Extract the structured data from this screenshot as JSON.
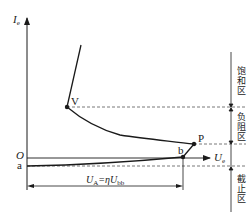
{
  "diagram": {
    "axes": {
      "y_label": "I",
      "y_label_sub": "e",
      "x_label": "U",
      "x_label_sub": "e",
      "origin_label": "O"
    },
    "points": {
      "a": "a",
      "b": "b",
      "P": "P",
      "V": "V"
    },
    "dimension": {
      "label_main": "U",
      "label_sub_A": "A",
      "label_eq": "=η",
      "label_U": "U",
      "label_sub_bb": "bb"
    },
    "regions": [
      {
        "name": "saturation",
        "label": "饱和区"
      },
      {
        "name": "negative-resistance",
        "label": "负阻区"
      },
      {
        "name": "cutoff",
        "label": "截止区"
      }
    ],
    "colors": {
      "line": "#1a1a1a",
      "dashed": "#555555",
      "background": "#ffffff"
    }
  }
}
